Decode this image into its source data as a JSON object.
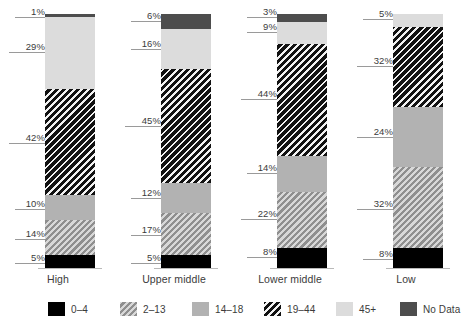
{
  "chart_data": {
    "type": "bar",
    "subtype": "stacked-100-percent",
    "title": "",
    "xlabel": "",
    "ylabel": "",
    "ylim": [
      0,
      100
    ],
    "grid": false,
    "legend_position": "bottom",
    "categories": [
      "High",
      "Upper middle",
      "Lower middle",
      "Low"
    ],
    "series": [
      {
        "name": "0–4",
        "values": [
          5,
          5,
          8,
          8
        ]
      },
      {
        "name": "2–13",
        "values": [
          14,
          17,
          22,
          32
        ]
      },
      {
        "name": "14–18",
        "values": [
          10,
          12,
          14,
          24
        ]
      },
      {
        "name": "19–44",
        "values": [
          42,
          45,
          44,
          32
        ]
      },
      {
        "name": "45+",
        "values": [
          29,
          16,
          9,
          5
        ]
      },
      {
        "name": "No Data",
        "values": [
          1,
          6,
          3,
          0
        ]
      }
    ],
    "annotations": [
      {
        "category": "High",
        "series": "No Data",
        "label": "1%"
      },
      {
        "category": "High",
        "series": "45+",
        "label": "29%"
      },
      {
        "category": "High",
        "series": "19–44",
        "label": "42%"
      },
      {
        "category": "High",
        "series": "14–18",
        "label": "10%"
      },
      {
        "category": "High",
        "series": "2–13",
        "label": "14%"
      },
      {
        "category": "High",
        "series": "0–4",
        "label": "5%"
      },
      {
        "category": "Upper middle",
        "series": "No Data",
        "label": "6%"
      },
      {
        "category": "Upper middle",
        "series": "45+",
        "label": "16%"
      },
      {
        "category": "Upper middle",
        "series": "19–44",
        "label": "45%"
      },
      {
        "category": "Upper middle",
        "series": "14–18",
        "label": "12%"
      },
      {
        "category": "Upper middle",
        "series": "2–13",
        "label": "17%"
      },
      {
        "category": "Upper middle",
        "series": "0–4",
        "label": "5%"
      },
      {
        "category": "Lower middle",
        "series": "No Data",
        "label": "3%"
      },
      {
        "category": "Lower middle",
        "series": "45+",
        "label": "9%"
      },
      {
        "category": "Lower middle",
        "series": "19–44",
        "label": "44%"
      },
      {
        "category": "Lower middle",
        "series": "14–18",
        "label": "14%"
      },
      {
        "category": "Lower middle",
        "series": "2–13",
        "label": "22%"
      },
      {
        "category": "Lower middle",
        "series": "0–4",
        "label": "8%"
      },
      {
        "category": "Low",
        "series": "45+",
        "label": "5%"
      },
      {
        "category": "Low",
        "series": "19–44",
        "label": "32%"
      },
      {
        "category": "Low",
        "series": "14–18",
        "label": "24%"
      },
      {
        "category": "Low",
        "series": "2–13",
        "label": "32%"
      },
      {
        "category": "Low",
        "series": "0–4",
        "label": "8%"
      }
    ],
    "colors": {
      "0-4": "#000000",
      "2-13": "#8f8f8f",
      "14-18": "#b2b2b2",
      "19-44": "#1a1a1a",
      "45+": "#dcdcdc",
      "no-data": "#4d4d4d"
    }
  },
  "groups": [
    {
      "label": "High",
      "segments": [
        {
          "key": "no-data",
          "value": 1,
          "label": "1%"
        },
        {
          "key": "45",
          "value": 29,
          "label": "29%"
        },
        {
          "key": "19-44",
          "value": 42,
          "label": "42%"
        },
        {
          "key": "14-18",
          "value": 10,
          "label": "10%"
        },
        {
          "key": "2-13",
          "value": 14,
          "label": "14%"
        },
        {
          "key": "0-4",
          "value": 5,
          "label": "5%"
        }
      ]
    },
    {
      "label": "Upper middle",
      "segments": [
        {
          "key": "no-data",
          "value": 6,
          "label": "6%"
        },
        {
          "key": "45",
          "value": 16,
          "label": "16%"
        },
        {
          "key": "19-44",
          "value": 45,
          "label": "45%"
        },
        {
          "key": "14-18",
          "value": 12,
          "label": "12%"
        },
        {
          "key": "2-13",
          "value": 17,
          "label": "17%"
        },
        {
          "key": "0-4",
          "value": 5,
          "label": "5%"
        }
      ]
    },
    {
      "label": "Lower middle",
      "segments": [
        {
          "key": "no-data",
          "value": 3,
          "label": "3%"
        },
        {
          "key": "45",
          "value": 9,
          "label": "9%"
        },
        {
          "key": "19-44",
          "value": 44,
          "label": "44%"
        },
        {
          "key": "14-18",
          "value": 14,
          "label": "14%"
        },
        {
          "key": "2-13",
          "value": 22,
          "label": "22%"
        },
        {
          "key": "0-4",
          "value": 8,
          "label": "8%"
        }
      ]
    },
    {
      "label": "Low",
      "segments": [
        {
          "key": "45",
          "value": 5,
          "label": "5%"
        },
        {
          "key": "19-44",
          "value": 32,
          "label": "32%"
        },
        {
          "key": "14-18",
          "value": 24,
          "label": "24%"
        },
        {
          "key": "2-13",
          "value": 32,
          "label": "32%"
        },
        {
          "key": "0-4",
          "value": 8,
          "label": "8%"
        }
      ]
    }
  ],
  "legend": {
    "items": [
      {
        "key": "0-4",
        "label": "0–4"
      },
      {
        "key": "2-13",
        "label": "2–13"
      },
      {
        "key": "14-18",
        "label": "14–18"
      },
      {
        "key": "19-44",
        "label": "19–44"
      },
      {
        "key": "45",
        "label": "45+"
      },
      {
        "key": "no-data",
        "label": "No Data"
      }
    ]
  }
}
